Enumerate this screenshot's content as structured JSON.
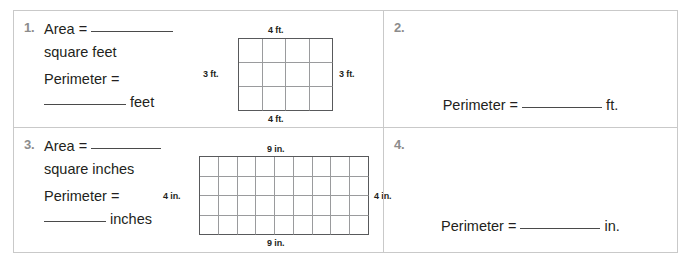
{
  "worksheet": {
    "cells": [
      {
        "number": "1.",
        "lines": {
          "area_label": "Area =",
          "area_unit": "square feet",
          "perimeter_label": "Perimeter =",
          "perimeter_unit": "feet"
        },
        "figure": {
          "columns": 4,
          "rows": 3,
          "top_label": "4 ft.",
          "bottom_label": "4 ft.",
          "left_label": "3 ft.",
          "right_label": "3 ft."
        }
      },
      {
        "number": "2.",
        "answer_label": "Perimeter =",
        "answer_unit": "ft."
      },
      {
        "number": "3.",
        "lines": {
          "area_label": "Area =",
          "area_unit": "square inches",
          "perimeter_label": "Perimeter =",
          "perimeter_unit": "inches"
        },
        "figure": {
          "columns": 9,
          "rows": 4,
          "top_label": "9 in.",
          "bottom_label": "9 in.",
          "left_label": "4 in.",
          "right_label": "4 in."
        }
      },
      {
        "number": "4.",
        "answer_label": "Perimeter =",
        "answer_unit": "in."
      }
    ]
  },
  "colors": {
    "border": "#c9c9c9",
    "grid_outer": "#58595b",
    "grid_inner": "#9a9b9d",
    "text": "#231f20",
    "number": "#8c8c8c",
    "blank_rule": "#4a4a4a"
  }
}
